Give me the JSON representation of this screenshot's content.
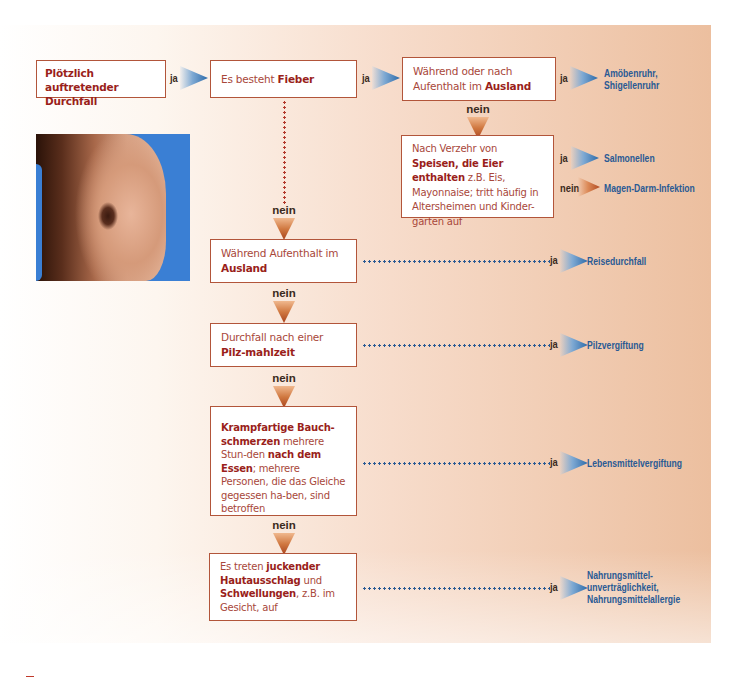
{
  "flowchart": {
    "start": {
      "text": "Plötzlich auftretender Durchfall",
      "to_next": "ja"
    },
    "fever": {
      "text_parts": [
        "Es besteht ",
        "Fieber"
      ],
      "yes": "ja",
      "no": "nein"
    },
    "abroad_fever": {
      "text_parts": [
        "Während oder nach Aufenthalt im ",
        "Ausland"
      ],
      "yes": "ja",
      "no": "nein",
      "yes_result": [
        "Amöbenruhr,",
        "Shigellenruhr"
      ]
    },
    "eggs": {
      "text_parts": [
        "Nach Verzehr von ",
        "Speisen, die Eier enthalten",
        " z.B. Eis, Mayonnaise; tritt häufig in Altersheimen und Kinder-gärten auf"
      ],
      "yes": "ja",
      "yes_result": "Salmonellen",
      "no": "nein",
      "no_result": "Magen-Darm-Infektion"
    },
    "abroad": {
      "text_parts": [
        "Während Aufenthalt im ",
        "Ausland"
      ],
      "yes": "ja",
      "yes_result": "Reisedurchfall",
      "no": "nein"
    },
    "mushroom": {
      "text_parts": [
        "Durchfall nach einer ",
        "Pilz-mahlzeit"
      ],
      "yes": "ja",
      "yes_result": "Pilzvergiftung",
      "no": "nein"
    },
    "cramps": {
      "text_parts": [
        "Krampfartige Bauch-schmerzen",
        " mehrere Stun-den ",
        "nach dem Essen",
        "; mehrere Personen, die das Gleiche gegessen ha-ben, sind betroffen"
      ],
      "yes": "ja",
      "yes_result": "Lebensmittelvergiftung",
      "no": "nein"
    },
    "rash": {
      "text_parts": [
        "Es treten ",
        "juckender Hautausschlag",
        " und ",
        "Schwellungen",
        ", z.B. im Gesicht, auf"
      ],
      "yes": "ja",
      "yes_result": [
        "Nahrungsmittel-",
        "unverträglichkeit,",
        "Nahrungsmittelallergie"
      ]
    }
  },
  "colors": {
    "box_border": "#b2553a",
    "emphasis_text": "#9a1f1b",
    "body_text": "#a8473a",
    "result_text": "#2a5a94",
    "yes_arrow": "#2c6aa9",
    "no_arrow": "#b24a22",
    "background_gradient": [
      "#ffffff",
      "#ecbf9f"
    ]
  },
  "image": {
    "description": "abdomen-photo"
  }
}
